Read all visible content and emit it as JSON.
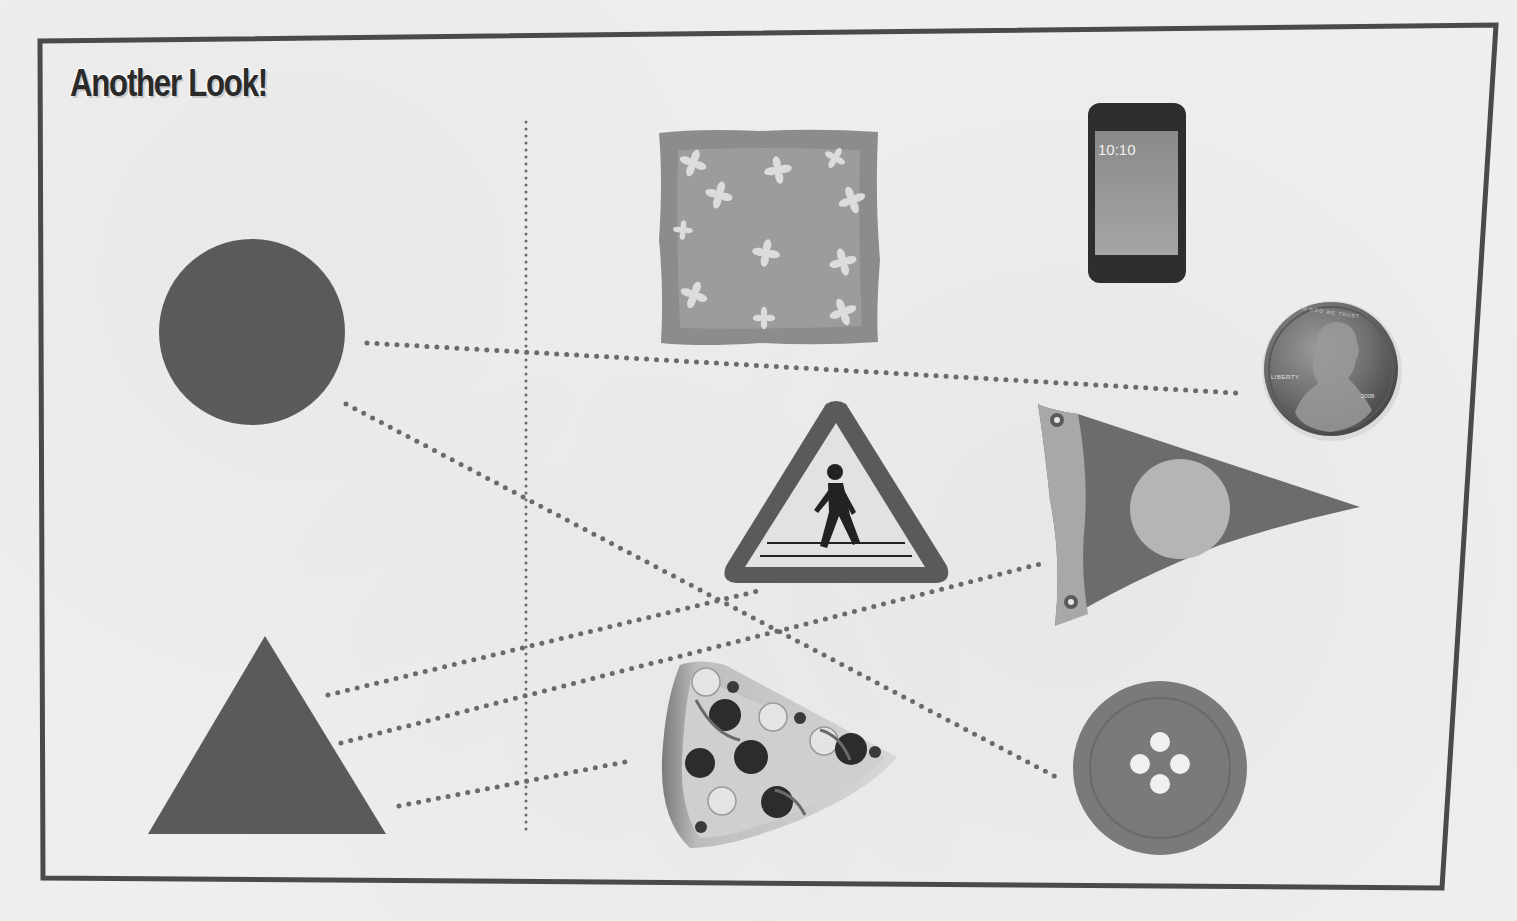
{
  "worksheet": {
    "title": "Another Look!",
    "instruction_type": "match-shapes-to-objects",
    "divider": "vertical-dotted-line"
  },
  "shapes": [
    {
      "id": "circle",
      "label": "circle",
      "color": "#555555"
    },
    {
      "id": "triangle",
      "label": "triangle",
      "color": "#555555"
    }
  ],
  "objects": [
    {
      "id": "napkin",
      "label": "square napkin with flowers",
      "shape": "square"
    },
    {
      "id": "phone",
      "label": "smartphone",
      "shape": "rectangle",
      "screen_text": "10:10"
    },
    {
      "id": "penny",
      "label": "penny coin",
      "shape": "circle",
      "inscriptions": {
        "motto": "IN GOD WE TRUST",
        "liberty": "LIBERTY",
        "year": "2008"
      }
    },
    {
      "id": "crossing-sign",
      "label": "pedestrian crossing sign",
      "shape": "triangle"
    },
    {
      "id": "pennant",
      "label": "pennant flag",
      "shape": "triangle"
    },
    {
      "id": "pizza",
      "label": "pizza slice",
      "shape": "triangle"
    },
    {
      "id": "button",
      "label": "sewing button",
      "shape": "circle"
    }
  ],
  "connections": [
    {
      "from": "circle",
      "to": "penny"
    },
    {
      "from": "circle",
      "to": "button"
    },
    {
      "from": "triangle",
      "to": "crossing-sign"
    },
    {
      "from": "triangle",
      "to": "pennant"
    },
    {
      "from": "triangle",
      "to": "pizza"
    }
  ],
  "colors": {
    "frame": "#4a4a4a",
    "shape_fill": "#5a5a5a",
    "dot_line": "#6a6a6a",
    "paper": "#eeeeee"
  }
}
